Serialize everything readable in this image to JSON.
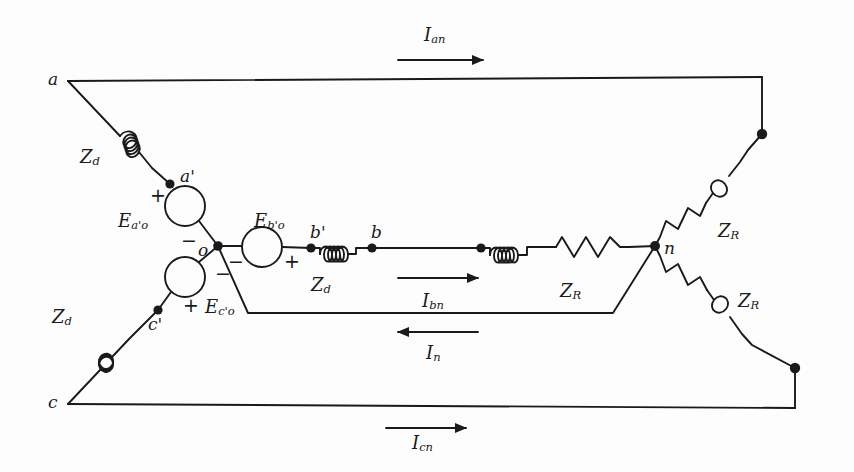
{
  "diagram": {
    "stroke_color": "#1a1a1a",
    "background": "#fdfdfd",
    "nodes": [
      {
        "key": "a",
        "label": "a",
        "x": 68,
        "y": 81
      },
      {
        "key": "ap",
        "label": "a'",
        "x": 170,
        "y": 184
      },
      {
        "key": "o",
        "label": "o",
        "x": 218,
        "y": 246
      },
      {
        "key": "bp",
        "label": "b'",
        "x": 311,
        "y": 248
      },
      {
        "key": "b",
        "label": "b",
        "x": 372,
        "y": 248
      },
      {
        "key": "cp",
        "label": "c'",
        "x": 158,
        "y": 310
      },
      {
        "key": "c",
        "label": "c",
        "x": 68,
        "y": 404
      },
      {
        "key": "n",
        "label": "n",
        "x": 655,
        "y": 246
      }
    ],
    "sources": [
      {
        "key": "Eao",
        "label": "E",
        "sub": "a'o",
        "plus": "+",
        "minus": "−"
      },
      {
        "key": "Ebo",
        "label": "E",
        "sub": "b'o",
        "plus": "+",
        "minus": "−"
      },
      {
        "key": "Eco",
        "label": "E",
        "sub": "c'o",
        "plus": "+",
        "minus": "−"
      }
    ],
    "impedances": [
      {
        "key": "Zd_a",
        "label": "Z",
        "sub": "d",
        "kind": "inductor"
      },
      {
        "key": "Zd_b",
        "label": "Z",
        "sub": "d",
        "kind": "inductor"
      },
      {
        "key": "Zd_c",
        "label": "Z",
        "sub": "d",
        "kind": "inductor"
      },
      {
        "key": "ZR_a",
        "label": "Z",
        "sub": "R",
        "kind": "resistor-inductor"
      },
      {
        "key": "ZR_b",
        "label": "Z",
        "sub": "R",
        "kind": "resistor-inductor"
      },
      {
        "key": "ZR_c",
        "label": "Z",
        "sub": "R",
        "kind": "resistor-inductor"
      }
    ],
    "currents": [
      {
        "key": "Ian",
        "label": "I",
        "sub": "an",
        "direction": "right"
      },
      {
        "key": "Ibn",
        "label": "I",
        "sub": "bn",
        "direction": "right"
      },
      {
        "key": "Icn",
        "label": "I",
        "sub": "cn",
        "direction": "right"
      },
      {
        "key": "In",
        "label": "I",
        "sub": "n",
        "direction": "left"
      }
    ],
    "labels": {
      "node_a": "a",
      "node_a_prime": "a'",
      "node_o": "o",
      "node_b_prime": "b'",
      "node_b": "b",
      "node_c_prime": "c'",
      "node_c": "c",
      "node_n": "n",
      "src_a_main": "E",
      "src_a_sub": "a'o",
      "src_b_main": "E",
      "src_b_sub": "b'o",
      "src_c_main": "E",
      "src_c_sub": "c'o",
      "zd_main": "Z",
      "zd_sub": "d",
      "zr_main": "Z",
      "zr_sub": "R",
      "cur_an_main": "I",
      "cur_an_sub": "an",
      "cur_bn_main": "I",
      "cur_bn_sub": "bn",
      "cur_cn_main": "I",
      "cur_cn_sub": "cn",
      "cur_n_main": "I",
      "cur_n_sub": "n",
      "plus": "+",
      "minus": "−"
    }
  }
}
